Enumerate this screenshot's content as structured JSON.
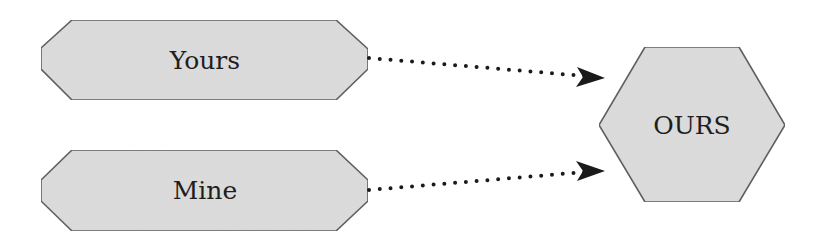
{
  "diagram": {
    "nodes": [
      {
        "id": "yours",
        "label": "Yours",
        "shape": "elongated-octagon"
      },
      {
        "id": "mine",
        "label": "Mine",
        "shape": "elongated-octagon"
      },
      {
        "id": "ours",
        "label": "OURS",
        "shape": "hexagon"
      }
    ],
    "edges": [
      {
        "from": "yours",
        "to": "ours",
        "style": "dotted-arrow"
      },
      {
        "from": "mine",
        "to": "ours",
        "style": "dotted-arrow"
      }
    ],
    "colors": {
      "fill": "#dcdcdc",
      "stroke": "#5a5a5a",
      "text": "#1e1e1e",
      "arrow": "#1a1a1a"
    }
  }
}
